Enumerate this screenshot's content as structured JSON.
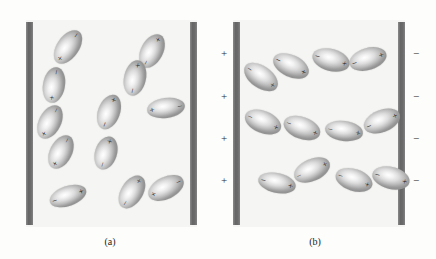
{
  "figure": {
    "width": 436,
    "height": 259,
    "background_color": "#fdfdfc",
    "field_color": "#f5f5f3",
    "plate_color": "#6e6e6e",
    "sign_color": "#1a1a1a"
  },
  "panels": [
    {
      "id": "panel-a",
      "caption": "(a)",
      "caption_x": 90,
      "caption_y": 236,
      "field": {
        "x": 26,
        "y": 20,
        "w": 171,
        "h": 207
      },
      "plates": [
        {
          "name": "left-plate",
          "x": 26,
          "y": 22,
          "w": 7,
          "h": 203,
          "polarity": ""
        },
        {
          "name": "right-plate",
          "x": 190,
          "y": 22,
          "w": 7,
          "h": 203,
          "polarity": ""
        }
      ],
      "external_charges": [],
      "dipoles": [
        {
          "cx": 68,
          "cy": 47,
          "rx": 19,
          "ry": 11,
          "rot": -55,
          "neg_end": "b",
          "pos_end": "a"
        },
        {
          "cx": 152,
          "cy": 51,
          "rx": 18,
          "ry": 11,
          "rot": -62,
          "neg_end": "a",
          "pos_end": "b"
        },
        {
          "cx": 54,
          "cy": 85,
          "rx": 18,
          "ry": 11,
          "rot": -80,
          "neg_end": "b",
          "pos_end": "a"
        },
        {
          "cx": 135,
          "cy": 78,
          "rx": 18,
          "ry": 11,
          "rot": -78,
          "neg_end": "a",
          "pos_end": "b"
        },
        {
          "cx": 50,
          "cy": 122,
          "rx": 18,
          "ry": 11,
          "rot": -63,
          "neg_end": "b",
          "pos_end": "a"
        },
        {
          "cx": 166,
          "cy": 108,
          "rx": 19,
          "ry": 10,
          "rot": -8,
          "neg_end": "b",
          "pos_end": "a"
        },
        {
          "cx": 109,
          "cy": 112,
          "rx": 18,
          "ry": 11,
          "rot": -70,
          "neg_end": "a",
          "pos_end": "b"
        },
        {
          "cx": 61,
          "cy": 152,
          "rx": 18,
          "ry": 11,
          "rot": -63,
          "neg_end": "b",
          "pos_end": "a"
        },
        {
          "cx": 106,
          "cy": 153,
          "rx": 17,
          "ry": 11,
          "rot": -73,
          "neg_end": "a",
          "pos_end": "b"
        },
        {
          "cx": 132,
          "cy": 192,
          "rx": 18,
          "ry": 11,
          "rot": -58,
          "neg_end": "a",
          "pos_end": "b"
        },
        {
          "cx": 166,
          "cy": 188,
          "rx": 19,
          "ry": 11,
          "rot": -26,
          "neg_end": "b",
          "pos_end": "a"
        },
        {
          "cx": 68,
          "cy": 196,
          "rx": 19,
          "ry": 10,
          "rot": -19,
          "neg_end": "a",
          "pos_end": "b"
        }
      ]
    },
    {
      "id": "panel-b",
      "caption": "(b)",
      "caption_x": 295,
      "caption_y": 236,
      "field": {
        "x": 233,
        "y": 20,
        "w": 172,
        "h": 207
      },
      "plates": [
        {
          "name": "left-plate",
          "x": 233,
          "y": 22,
          "w": 7,
          "h": 203,
          "polarity": "+"
        },
        {
          "name": "right-plate",
          "x": 398,
          "y": 22,
          "w": 7,
          "h": 203,
          "polarity": "-"
        }
      ],
      "external_charges": [
        {
          "sign": "+",
          "x": 219,
          "y": 48
        },
        {
          "sign": "+",
          "x": 219,
          "y": 91
        },
        {
          "sign": "+",
          "x": 219,
          "y": 133
        },
        {
          "sign": "+",
          "x": 219,
          "y": 175
        },
        {
          "sign": "-",
          "x": 411,
          "y": 48
        },
        {
          "sign": "-",
          "x": 411,
          "y": 91
        },
        {
          "sign": "-",
          "x": 411,
          "y": 133
        },
        {
          "sign": "-",
          "x": 411,
          "y": 175
        }
      ],
      "dipoles": [
        {
          "cx": 261,
          "cy": 77,
          "rx": 19,
          "ry": 11,
          "rot": 35,
          "neg_end": "a",
          "pos_end": "b"
        },
        {
          "cx": 291,
          "cy": 66,
          "rx": 19,
          "ry": 11,
          "rot": 25,
          "neg_end": "a",
          "pos_end": "b"
        },
        {
          "cx": 331,
          "cy": 60,
          "rx": 19,
          "ry": 11,
          "rot": 15,
          "neg_end": "a",
          "pos_end": "b"
        },
        {
          "cx": 368,
          "cy": 59,
          "rx": 19,
          "ry": 11,
          "rot": -17,
          "neg_end": "a",
          "pos_end": "b"
        },
        {
          "cx": 263,
          "cy": 122,
          "rx": 19,
          "ry": 11,
          "rot": 22,
          "neg_end": "a",
          "pos_end": "b"
        },
        {
          "cx": 302,
          "cy": 128,
          "rx": 19,
          "ry": 11,
          "rot": 20,
          "neg_end": "a",
          "pos_end": "b"
        },
        {
          "cx": 344,
          "cy": 131,
          "rx": 19,
          "ry": 10,
          "rot": 8,
          "neg_end": "a",
          "pos_end": "b"
        },
        {
          "cx": 382,
          "cy": 121,
          "rx": 19,
          "ry": 11,
          "rot": -22,
          "neg_end": "a",
          "pos_end": "b"
        },
        {
          "cx": 277,
          "cy": 183,
          "rx": 19,
          "ry": 10,
          "rot": 12,
          "neg_end": "a",
          "pos_end": "b"
        },
        {
          "cx": 312,
          "cy": 170,
          "rx": 19,
          "ry": 11,
          "rot": -24,
          "neg_end": "a",
          "pos_end": "b"
        },
        {
          "cx": 354,
          "cy": 180,
          "rx": 19,
          "ry": 11,
          "rot": 18,
          "neg_end": "a",
          "pos_end": "b"
        },
        {
          "cx": 391,
          "cy": 178,
          "rx": 19,
          "ry": 11,
          "rot": 14,
          "neg_end": "a",
          "pos_end": "b"
        }
      ]
    }
  ],
  "legend": {
    "negative_symbol": "−",
    "positive_symbol": "+"
  }
}
